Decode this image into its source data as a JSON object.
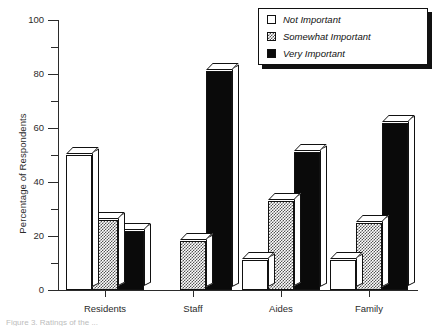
{
  "chart_data": {
    "type": "bar",
    "title": "",
    "xlabel": "",
    "ylabel": "Percentage of Respondents",
    "ylim": [
      0,
      100
    ],
    "ytick_labels": [
      "0",
      "20",
      "40",
      "60",
      "80",
      "100"
    ],
    "ytick_values": [
      0,
      20,
      40,
      60,
      80,
      100
    ],
    "minor_ticks": [
      10,
      30,
      50,
      70,
      90
    ],
    "grid": false,
    "legend_position": "top-right",
    "categories": [
      "Residents",
      "Staff",
      "Aides",
      "Family"
    ],
    "series": [
      {
        "name": "Not Important",
        "values": [
          50,
          0,
          11,
          11
        ]
      },
      {
        "name": "Somewhat Important",
        "values": [
          26,
          18,
          33,
          25
        ]
      },
      {
        "name": "Very Important",
        "values": [
          22,
          81,
          51,
          62
        ]
      }
    ]
  },
  "legend": {
    "items": [
      {
        "label": "Not Important",
        "swatch": "open-square-swatch"
      },
      {
        "label": "Somewhat Important",
        "swatch": "checkered-square-swatch"
      },
      {
        "label": "Very Important",
        "swatch": "filled-square-swatch"
      }
    ]
  },
  "caption": "Figure 3. Ratings of the ..."
}
